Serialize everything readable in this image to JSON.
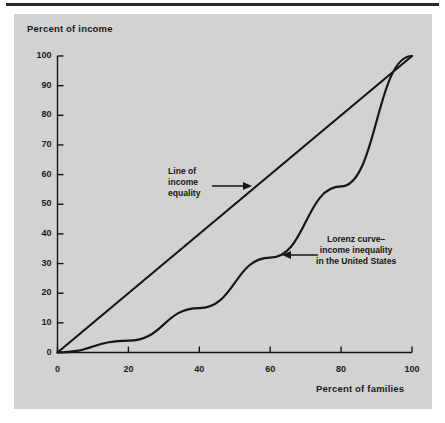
{
  "figure": {
    "panel_color": "#d2d2d2",
    "rule_color": "#2b2b2b",
    "ink_color": "#161616"
  },
  "axes": {
    "y_title": "Percent of income",
    "x_title": "Percent of families",
    "y_ticks": [
      "100",
      "90",
      "80",
      "70",
      "60",
      "50",
      "40",
      "30",
      "20",
      "10",
      "0"
    ],
    "x_ticks": [
      "0",
      "20",
      "40",
      "60",
      "80",
      "100"
    ]
  },
  "annotations": {
    "equality": {
      "line1": "Line of",
      "line2": "income",
      "line3": "equality",
      "arrow": "arrow-right"
    },
    "lorenz": {
      "line1": "Lorenz curve–",
      "line2": "income inequality",
      "line3": "in the United States",
      "arrow": "arrow-left"
    }
  },
  "chart_data": {
    "type": "line",
    "title": "",
    "subtitle": "",
    "xlabel": "Percent of families",
    "ylabel": "Percent of income",
    "xlim": [
      0,
      100
    ],
    "ylim": [
      0,
      100
    ],
    "xticks": [
      0,
      20,
      40,
      60,
      80,
      100
    ],
    "yticks": [
      0,
      10,
      20,
      30,
      40,
      50,
      60,
      70,
      80,
      90,
      100
    ],
    "grid": false,
    "legend": "none",
    "series": [
      {
        "name": "Line of income equality",
        "x": [
          0,
          100
        ],
        "y": [
          0,
          100
        ]
      },
      {
        "name": "Lorenz curve – income inequality in the United States",
        "x": [
          0,
          20,
          40,
          60,
          80,
          100
        ],
        "y": [
          0,
          4,
          15,
          32,
          56,
          100
        ]
      }
    ],
    "annotations": [
      {
        "text": "Line of income equality",
        "target_x": 42,
        "target_y": 42
      },
      {
        "text": "Lorenz curve– income inequality in the United States",
        "target_x": 72,
        "target_y": 42
      }
    ]
  }
}
